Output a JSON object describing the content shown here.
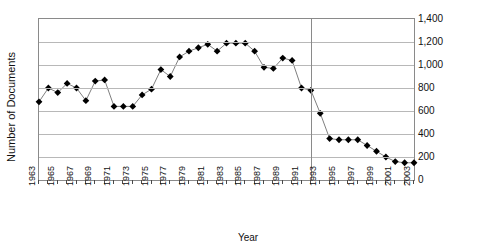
{
  "chart_data": {
    "type": "line",
    "title": "",
    "xlabel": "Year",
    "ylabel": "Number of Documents",
    "ylim": [
      0,
      1400
    ],
    "ytick_values": [
      0,
      200,
      400,
      600,
      800,
      1000,
      1200,
      1400
    ],
    "ytick_labels": [
      "0",
      "200",
      "400",
      "600",
      "800",
      "1,000",
      "1,200",
      "1,400"
    ],
    "ytick_side": "right",
    "grid": true,
    "grid_axis": "y",
    "legend": "none",
    "marker": "filled-diamond",
    "line_color": "#7f7f7f",
    "marker_color": "#000000",
    "grid_color": "#b8b8b8",
    "axis_color": "#8a8a8a",
    "xlim": [
      1963,
      2003
    ],
    "xtick_labels": [
      "1963",
      "1965",
      "1967",
      "1969",
      "1971",
      "1973",
      "1975",
      "1977",
      "1979",
      "1981",
      "1983",
      "1985",
      "1987",
      "1989",
      "1991",
      "1993",
      "1995",
      "1997",
      "1999",
      "2001",
      "2003"
    ],
    "xtick_label_rotation": 90,
    "annotations": [
      {
        "type": "vertical-reference-line",
        "x": 1992,
        "color": "#8a8a8a"
      }
    ],
    "x": [
      1963,
      1964,
      1965,
      1966,
      1967,
      1968,
      1969,
      1970,
      1971,
      1972,
      1973,
      1974,
      1975,
      1976,
      1977,
      1978,
      1979,
      1980,
      1981,
      1982,
      1983,
      1984,
      1985,
      1986,
      1987,
      1988,
      1989,
      1990,
      1991,
      1992,
      1993,
      1994,
      1995,
      1996,
      1997,
      1998,
      1999,
      2000,
      2001,
      2002,
      2003
    ],
    "values": [
      680,
      800,
      760,
      840,
      800,
      690,
      860,
      870,
      640,
      640,
      640,
      740,
      790,
      960,
      900,
      1070,
      1120,
      1150,
      1180,
      1120,
      1190,
      1190,
      1190,
      1120,
      980,
      970,
      1060,
      1040,
      800,
      780,
      580,
      360,
      350,
      350,
      350,
      300,
      250,
      200,
      160,
      150,
      150
    ]
  }
}
